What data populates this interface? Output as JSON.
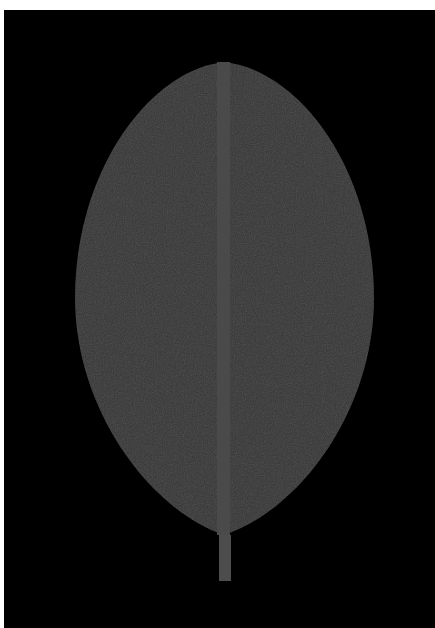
{
  "image": {
    "subject": "Stylized leaf on black background",
    "width": 435,
    "height": 628
  },
  "colors": {
    "border": "#ffffff",
    "background": "#000000",
    "leaf_body": "#383838",
    "midrib": "#4a4a4a",
    "stem": "#4d4d4d"
  },
  "leaf": {
    "tip": [
      224,
      62
    ],
    "base": [
      224,
      535
    ],
    "left_extent": 75,
    "right_extent": 374,
    "widest_y": 298
  },
  "midrib": {
    "x": 217,
    "width": 13,
    "top": 62,
    "bottom": 535
  },
  "stem": {
    "x": 219,
    "width": 12,
    "top": 535,
    "bottom": 581
  }
}
